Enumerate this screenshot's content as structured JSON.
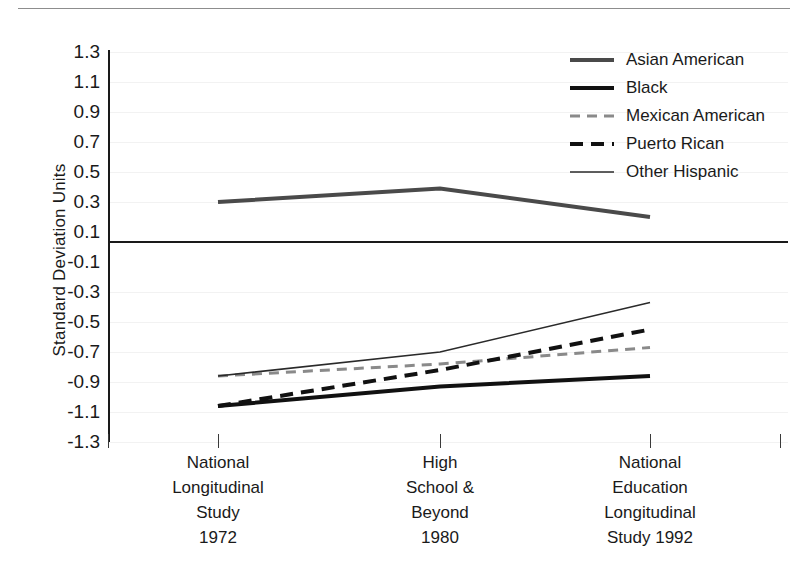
{
  "figure": {
    "y_axis_title": "Standard Deviation Units"
  },
  "chart_data": {
    "type": "line",
    "title": "",
    "xlabel": "",
    "ylabel": "Standard Deviation Units",
    "ylim": [
      -1.3,
      1.3
    ],
    "ytick_step": 0.2,
    "grid": true,
    "legend_position": "top-right",
    "zero_line": true,
    "categories": [
      "National Longitudinal Study 1972",
      "High School & Beyond 1980",
      "National Education Longitudinal Study 1992"
    ],
    "category_lines": [
      [
        "National",
        "Longitudinal",
        "Study",
        "1972"
      ],
      [
        "High",
        "School &",
        "Beyond",
        "1980"
      ],
      [
        "National",
        "Education",
        "Longitudinal",
        "Study 1992"
      ]
    ],
    "yticks": [
      "1.3",
      "1.1",
      "0.9",
      "0.7",
      "0.5",
      "0.3",
      "0.1",
      "-0.1",
      "-0.3",
      "-0.5",
      "-0.7",
      "-0.9",
      "-1.1",
      "-1.3"
    ],
    "ytick_values": [
      1.3,
      1.1,
      0.9,
      0.7,
      0.5,
      0.3,
      0.1,
      -0.1,
      -0.3,
      -0.5,
      -0.7,
      -0.9,
      -1.1,
      -1.3
    ],
    "series": [
      {
        "name": "Asian American",
        "values": [
          0.3,
          0.39,
          0.2
        ],
        "color": "#4a4a4a",
        "width": 4,
        "dash": "none"
      },
      {
        "name": "Black",
        "values": [
          -1.06,
          -0.93,
          -0.86
        ],
        "color": "#111111",
        "width": 4,
        "dash": "none"
      },
      {
        "name": "Mexican American",
        "values": [
          -0.86,
          -0.78,
          -0.67
        ],
        "color": "#8a8a8a",
        "width": 3,
        "dash": "10,7"
      },
      {
        "name": "Puerto Rican",
        "values": [
          -1.06,
          -0.82,
          -0.55
        ],
        "color": "#111111",
        "width": 4,
        "dash": "13,8"
      },
      {
        "name": "Other Hispanic",
        "values": [
          -0.86,
          -0.7,
          -0.37
        ],
        "color": "#2a2a2a",
        "width": 1.6,
        "dash": "none"
      }
    ]
  }
}
